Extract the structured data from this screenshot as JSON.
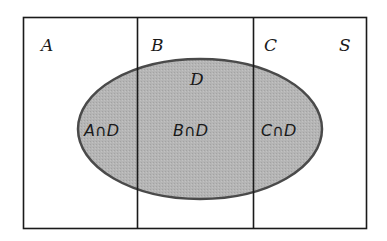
{
  "diagram": {
    "type": "venn",
    "universe_label": "S",
    "sets": [
      {
        "id": "A",
        "label": "A"
      },
      {
        "id": "B",
        "label": "B"
      },
      {
        "id": "C",
        "label": "C"
      }
    ],
    "ellipse": {
      "id": "D",
      "label": "D"
    },
    "intersections": [
      {
        "label": "A∩D"
      },
      {
        "label": "B∩D"
      },
      {
        "label": "C∩D"
      }
    ],
    "colors": {
      "ellipse_fill": "#b3b3b3",
      "ellipse_stroke": "#4a4a4a",
      "line": "#1a1a1a",
      "background": "#ffffff"
    }
  }
}
